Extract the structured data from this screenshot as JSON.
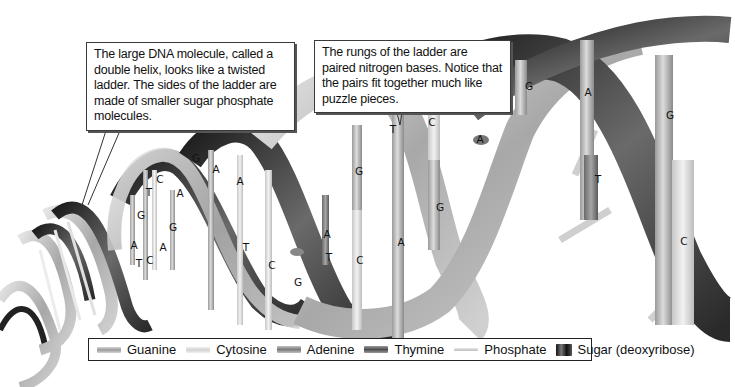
{
  "callouts": [
    {
      "id": "helix-description",
      "text": "The large DNA molecule, called a double helix, looks like a twisted ladder. The sides of the ladder are made of smaller sugar phosphate molecules."
    },
    {
      "id": "rungs-description",
      "text": "The rungs of the ladder are paired nitrogen bases. Notice that the pairs fit together much like puzzle pieces."
    }
  ],
  "base_pairs": [
    {
      "top": "A",
      "bottom": "T"
    },
    {
      "top": "G",
      "bottom": "C"
    },
    {
      "top": "T",
      "bottom": "A"
    },
    {
      "top": "C",
      "bottom": "G"
    },
    {
      "top": "A",
      "bottom": "G"
    },
    {
      "top": "G",
      "bottom": "A"
    },
    {
      "top": "A",
      "bottom": "T"
    },
    {
      "top": "C",
      "bottom": "G"
    },
    {
      "top": "A",
      "bottom": "T"
    },
    {
      "top": "G",
      "bottom": "C"
    },
    {
      "top": "T",
      "bottom": "A"
    },
    {
      "top": "C",
      "bottom": "G"
    },
    {
      "top": "A",
      "bottom": ""
    },
    {
      "top": "G",
      "bottom": ""
    },
    {
      "top": "A",
      "bottom": "T"
    },
    {
      "top": "G",
      "bottom": "C"
    }
  ],
  "labels": {
    "l1": "A",
    "l2": "T",
    "l3": "C",
    "l4": "A",
    "l5": "G",
    "l6": "T",
    "l7": "C",
    "l8": "A",
    "l9": "G",
    "l10": "G",
    "l11": "A",
    "l12": "A",
    "l13": "T",
    "l14": "C",
    "l15": "G",
    "l16": "A",
    "l17": "T",
    "l18": "G",
    "l19": "C",
    "l20": "T",
    "l21": "A",
    "l22": "C",
    "l23": "G",
    "l24": "A",
    "l25": "G",
    "l26": "A",
    "l27": "T",
    "l28": "G",
    "l29": "C"
  },
  "legend": {
    "items": [
      {
        "label": "Guanine",
        "swatch": "guanine"
      },
      {
        "label": "Cytosine",
        "swatch": "cytosine"
      },
      {
        "label": "Adenine",
        "swatch": "adenine"
      },
      {
        "label": "Thymine",
        "swatch": "thymine"
      },
      {
        "label": "Phosphate",
        "swatch": "phosphate"
      },
      {
        "label": "Sugar (deoxyribose)",
        "swatch": "sugar"
      }
    ]
  }
}
